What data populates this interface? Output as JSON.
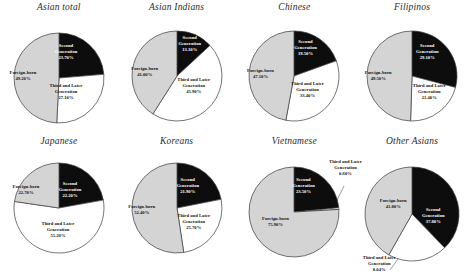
{
  "figure": {
    "background": "#ffffff",
    "slice_colors": {
      "foreign_born": "#d4d4d4",
      "second_generation": "#0d0d0d",
      "third_and_later": "#ffffff"
    },
    "stroke": "#3a3a3a"
  },
  "chart_data": [
    {
      "type": "pie",
      "title": "Asian total",
      "categories": [
        "Second Generation",
        "Third and Later Generation",
        "Foreign-born"
      ],
      "values": [
        23.7,
        27.1,
        49.2
      ],
      "labels": [
        {
          "name": "Second Generation",
          "value": "23.70%",
          "line1": "Second",
          "line2": "Generation"
        },
        {
          "name": "Third and Later Generation",
          "value": "27.10%",
          "line1": "Third and Later",
          "line2": "Generation"
        },
        {
          "name": "Foreign-born",
          "value": "49.20%",
          "line1": "Foreign-born",
          "line2": ""
        }
      ]
    },
    {
      "type": "pie",
      "title": "Asian Indians",
      "categories": [
        "Second Generation",
        "Third and Later Generation",
        "Foreign-born"
      ],
      "values": [
        13.1,
        45.9,
        41.0
      ],
      "labels": [
        {
          "name": "Second Generation",
          "value": "13.10%",
          "line1": "Second",
          "line2": "Generation"
        },
        {
          "name": "Third and Later Generation",
          "value": "45.90%",
          "line1": "Third and Later",
          "line2": "Generation"
        },
        {
          "name": "Foreign-born",
          "value": "41.00%",
          "line1": "Foreign-born",
          "line2": ""
        }
      ]
    },
    {
      "type": "pie",
      "title": "Chinese",
      "categories": [
        "Second Generation",
        "Third and Later Generation",
        "Foreign-born"
      ],
      "values": [
        19.5,
        33.4,
        47.1
      ],
      "labels": [
        {
          "name": "Second Generation",
          "value": "19.50%",
          "line1": "Second",
          "line2": "Generation"
        },
        {
          "name": "Third and Later Generation",
          "value": "33.40%",
          "line1": "Third and Later",
          "line2": "Generation"
        },
        {
          "name": "Foreign-born",
          "value": "47.10%",
          "line1": "Foreign-born",
          "line2": ""
        }
      ]
    },
    {
      "type": "pie",
      "title": "Filipinos",
      "categories": [
        "Second Generation",
        "Third and Later Generation",
        "Foreign-born"
      ],
      "values": [
        29.1,
        21.4,
        49.5
      ],
      "labels": [
        {
          "name": "Second Generation",
          "value": "29.10%",
          "line1": "Second",
          "line2": "Generation"
        },
        {
          "name": "Third and Later Generation",
          "value": "21.40%",
          "line1": "Third and Later",
          "line2": "Generation"
        },
        {
          "name": "Foreign-born",
          "value": "49.50%",
          "line1": "Foreign-born",
          "line2": ""
        }
      ]
    },
    {
      "type": "pie",
      "title": "Japanese",
      "categories": [
        "Second Generation",
        "Third and Later Generation",
        "Foreign-born"
      ],
      "values": [
        22.2,
        55.2,
        22.7
      ],
      "labels": [
        {
          "name": "Second Generation",
          "value": "22.20%",
          "line1": "Second",
          "line2": "Generation"
        },
        {
          "name": "Third and Later Generation",
          "value": "55.20%",
          "line1": "Third and Later",
          "line2": "Generation"
        },
        {
          "name": "Foreign-born",
          "value": "22.70%",
          "line1": "Foreign-born",
          "line2": ""
        }
      ]
    },
    {
      "type": "pie",
      "title": "Koreans",
      "categories": [
        "Second Generation",
        "Third and Later Generation",
        "Foreign-born"
      ],
      "values": [
        21.9,
        25.7,
        52.4
      ],
      "labels": [
        {
          "name": "Second Generation",
          "value": "21.90%",
          "line1": "Second",
          "line2": "Generation"
        },
        {
          "name": "Third and Later Generation",
          "value": "25.70%",
          "line1": "Third and Later",
          "line2": "Generation"
        },
        {
          "name": "Foreign-born",
          "value": "52.40%",
          "line1": "Foreign-born",
          "line2": ""
        }
      ]
    },
    {
      "type": "pie",
      "title": "Vietnamese",
      "categories": [
        "Second Generation",
        "Third and Later Generation",
        "Foreign-born"
      ],
      "values": [
        23.5,
        0.6,
        75.9
      ],
      "labels": [
        {
          "name": "Second Generation",
          "value": "23.50%",
          "line1": "Second",
          "line2": "Generation"
        },
        {
          "name": "Third and Later Generation",
          "value": "0.60%",
          "line1": "Third and Later",
          "line2": "Generation"
        },
        {
          "name": "Foreign-born",
          "value": "75.90%",
          "line1": "Foreign-born",
          "line2": ""
        }
      ]
    },
    {
      "type": "pie",
      "title": "Other Asians",
      "categories": [
        "Second Generation",
        "Third and Later Generation",
        "Foreign-born"
      ],
      "values": [
        37.8,
        20.4,
        41.8
      ],
      "labels": [
        {
          "name": "Second Generation",
          "value": "37.80%",
          "line1": "Second",
          "line2": "Generation"
        },
        {
          "name": "Third and Later Generation",
          "value": "0.04%",
          "line1": "Third and Later",
          "line2": "Generation"
        },
        {
          "name": "Foreign-born",
          "value": "41.80%",
          "line1": "Foreign-born",
          "line2": ""
        }
      ]
    }
  ]
}
